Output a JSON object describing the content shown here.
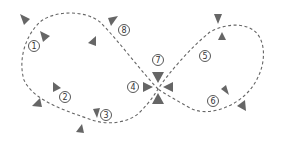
{
  "diagram": {
    "type": "figure-eight dashed path with numbered checkpoints and direction markers",
    "path_color": "#666666",
    "marker_color": "#666666",
    "labels": [
      {
        "id": "1",
        "text": "1",
        "x": 34,
        "y": 46
      },
      {
        "id": "2",
        "text": "2",
        "x": 65,
        "y": 97
      },
      {
        "id": "3",
        "text": "3",
        "x": 106,
        "y": 115
      },
      {
        "id": "4",
        "text": "4",
        "x": 133,
        "y": 87
      },
      {
        "id": "5",
        "text": "5",
        "x": 205,
        "y": 56
      },
      {
        "id": "6",
        "text": "6",
        "x": 213,
        "y": 101
      },
      {
        "id": "7",
        "text": "7",
        "x": 158,
        "y": 60
      },
      {
        "id": "8",
        "text": "8",
        "x": 124,
        "y": 30
      }
    ]
  }
}
